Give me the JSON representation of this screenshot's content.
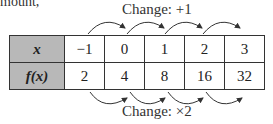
{
  "fragment_text": "mount,",
  "top_label": "Change: +1",
  "bottom_label": "Change: ×2",
  "table": {
    "rows": [
      {
        "header": "x",
        "values": [
          "−1",
          "0",
          "1",
          "2",
          "3"
        ]
      },
      {
        "header": "f(x)",
        "values": [
          "2",
          "4",
          "8",
          "16",
          "32"
        ]
      }
    ]
  },
  "colors": {
    "header_bg": "#b8b8b8",
    "border": "#333333"
  }
}
